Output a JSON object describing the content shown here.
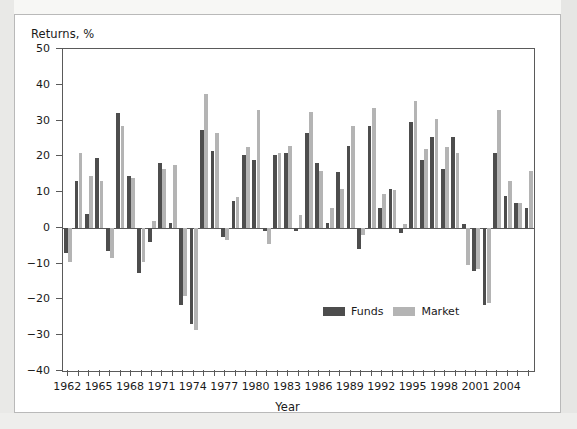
{
  "figure": {
    "background": "#ffffff",
    "page_background": "#f0f0ee",
    "border_color": "#b9b9b9"
  },
  "legend": {
    "position": "inside-center",
    "entries": [
      {
        "label": "Funds",
        "color": "#4d4d4d"
      },
      {
        "label": "Market",
        "color": "#b4b4b4"
      }
    ]
  },
  "chart_data": {
    "type": "bar",
    "title": "",
    "ylabel": "Returns, %",
    "xlabel": "Year",
    "ylim": [
      -40,
      50
    ],
    "yticks": [
      -40,
      -30,
      -20,
      -10,
      0,
      10,
      20,
      30,
      40,
      50
    ],
    "ytick_labels": [
      "-40",
      "-30",
      "-20",
      "-10",
      "0",
      "10",
      "20",
      "30",
      "40",
      "50"
    ],
    "xtick_labels": [
      "1962",
      "1965",
      "1968",
      "1971",
      "1974",
      "1977",
      "1980",
      "1983",
      "1986",
      "1989",
      "1992",
      "1995",
      "1998",
      "2001",
      "2004"
    ],
    "grid": false,
    "legend_position": "inside-center",
    "categories": [
      1962,
      1963,
      1964,
      1965,
      1966,
      1967,
      1968,
      1969,
      1970,
      1971,
      1972,
      1973,
      1974,
      1975,
      1976,
      1977,
      1978,
      1979,
      1980,
      1981,
      1982,
      1983,
      1984,
      1985,
      1986,
      1987,
      1988,
      1989,
      1990,
      1991,
      1992,
      1993,
      1994,
      1995,
      1996,
      1997,
      1998,
      1999,
      2000,
      2001,
      2002,
      2003,
      2004,
      2005,
      2006
    ],
    "series": [
      {
        "name": "Funds",
        "color": "#4d4d4d",
        "values": [
          -7.0,
          13.0,
          4.0,
          19.5,
          -6.5,
          32.0,
          14.5,
          -12.5,
          -4.0,
          18.0,
          1.5,
          -21.5,
          -27.0,
          27.5,
          21.5,
          -2.5,
          7.5,
          20.5,
          19.0,
          -1.0,
          20.5,
          21.0,
          -1.0,
          26.5,
          18.0,
          1.5,
          15.5,
          23.0,
          -6.0,
          28.5,
          5.5,
          11.0,
          -1.5,
          29.5,
          19.0,
          25.5,
          16.5,
          25.5,
          1.0,
          -12.0,
          -21.5,
          21.0,
          9.0,
          7.0,
          5.5
        ]
      },
      {
        "name": "Market",
        "color": "#b4b4b4",
        "values": [
          -9.5,
          21.0,
          14.5,
          13.0,
          -8.5,
          28.5,
          14.0,
          -9.5,
          2.0,
          16.5,
          17.5,
          -19.0,
          -28.5,
          37.5,
          26.5,
          -3.5,
          8.5,
          22.5,
          33.0,
          -4.5,
          21.0,
          23.0,
          3.5,
          32.5,
          16.0,
          5.5,
          11.0,
          28.5,
          -2.0,
          33.5,
          9.5,
          10.5,
          1.0,
          35.5,
          22.0,
          30.5,
          22.5,
          21.0,
          -10.5,
          -11.5,
          -21.0,
          33.0,
          13.0,
          7.0,
          16.0
        ]
      }
    ]
  }
}
